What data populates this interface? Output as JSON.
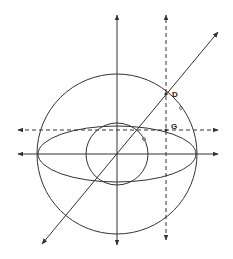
{
  "diagram": {
    "labels": {
      "D": "D",
      "G": "G"
    },
    "stroke_color": "#333333"
  }
}
